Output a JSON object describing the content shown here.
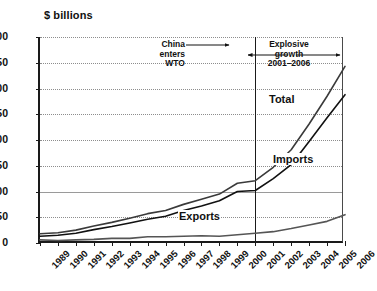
{
  "chart_data": {
    "type": "line",
    "title": "",
    "subtitle": "",
    "xlabel": "",
    "ylabel": "$ billions",
    "ylim": [
      0,
      400
    ],
    "ytick_step": 50,
    "yticks": [
      "0",
      "50",
      "100",
      "150",
      "200",
      "250",
      "300",
      "350",
      "400"
    ],
    "grid": true,
    "grid_style": "dotted-horizontal",
    "legend_position": "inline-labels",
    "x": [
      "1989",
      "1990",
      "1991",
      "1992",
      "1993",
      "1994",
      "1995",
      "1996",
      "1997",
      "1998",
      "1999",
      "2000",
      "2001",
      "2002",
      "2003",
      "2004",
      "2005",
      "2006"
    ],
    "categories": [
      "1989",
      "1990",
      "1991",
      "1992",
      "1993",
      "1994",
      "1995",
      "1996",
      "1997",
      "1998",
      "1999",
      "2000",
      "2001",
      "2002",
      "2003",
      "2004",
      "2005",
      "2006"
    ],
    "series": [
      {
        "name": "Total",
        "label": "Total",
        "color": "#3a3a3a",
        "values": [
          18,
          20,
          25,
          33,
          40,
          48,
          57,
          63,
          75,
          85,
          95,
          116,
          121,
          147,
          181,
          231,
          285,
          343
        ]
      },
      {
        "name": "Imports",
        "label": "Imports",
        "color": "#111111",
        "values": [
          13,
          15,
          19,
          26,
          32,
          39,
          46,
          52,
          63,
          72,
          82,
          100,
          102,
          125,
          152,
          197,
          243,
          288
        ]
      },
      {
        "name": "Exports",
        "label": "Exports",
        "color": "#555555",
        "values": [
          6,
          5,
          6,
          7,
          9,
          9,
          12,
          12,
          13,
          14,
          13,
          16,
          19,
          22,
          28,
          35,
          42,
          55
        ]
      }
    ],
    "annotations": [
      {
        "id": "china-wto",
        "lines": [
          "China",
          "enters",
          "WTO"
        ],
        "arrow": "right",
        "points_to_year": "2001"
      },
      {
        "id": "explosive-growth",
        "lines": [
          "Explosive",
          "growth",
          "2001–2006"
        ],
        "arrow": "double",
        "span_years": [
          "2001",
          "2006"
        ]
      }
    ],
    "reference_line": {
      "id": "wto-accession-line",
      "at_year": "2001",
      "style": "solid"
    }
  },
  "axis": {
    "y_title": "$ billions"
  }
}
